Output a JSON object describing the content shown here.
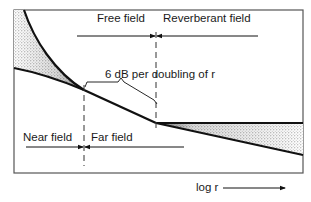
{
  "diagram": {
    "type": "sound-field-regions",
    "labels": {
      "free_field": "Free field",
      "reverberant_field": "Reverberant field",
      "slope": "6 dB per doubling of r",
      "near_field": "Near field",
      "far_field": "Far field",
      "x_axis": "log r"
    },
    "colors": {
      "line": "#111111",
      "frame": "#555555",
      "stipple": "#8a8a8a",
      "background": "#ffffff"
    }
  }
}
